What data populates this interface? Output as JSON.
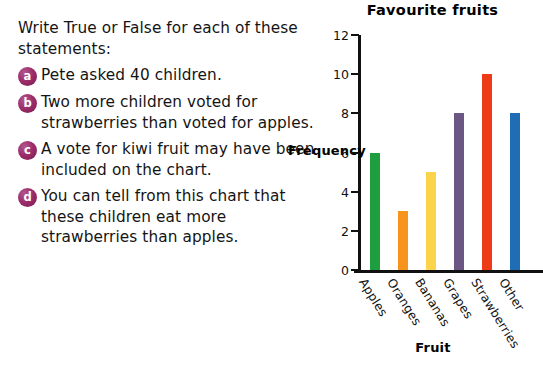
{
  "worksheet": {
    "intro": "Write True or False for each of these statements:",
    "questions": [
      {
        "marker": "a",
        "text": "Pete asked 40 children."
      },
      {
        "marker": "b",
        "text": "Two more children voted for strawberries than voted for apples."
      },
      {
        "marker": "c",
        "text": "A vote for kiwi fruit may have been included on the chart."
      },
      {
        "marker": "d",
        "text": "You can tell from this chart that these children eat more strawberries than apples."
      }
    ],
    "bullet_color": "#9c2c68"
  },
  "chart_data": {
    "type": "bar",
    "title": "Favourite  fruits",
    "xlabel": "Fruit",
    "ylabel": "Frequency",
    "categories": [
      "Apples",
      "Oranges",
      "Bananas",
      "Grapes",
      "Strawberries",
      "Other"
    ],
    "values": [
      6,
      3,
      5,
      8,
      10,
      8
    ],
    "colors": [
      "#1f9e3f",
      "#f7941e",
      "#fbd44c",
      "#6b5684",
      "#ee3b17",
      "#1f6eb5"
    ],
    "ylim": [
      0,
      12
    ],
    "ytick_labels": [
      "0",
      "2",
      "4",
      "6",
      "8",
      "10",
      "12"
    ],
    "ytick_values": [
      0,
      2,
      4,
      6,
      8,
      10,
      12
    ],
    "grid": false,
    "legend": "none"
  }
}
